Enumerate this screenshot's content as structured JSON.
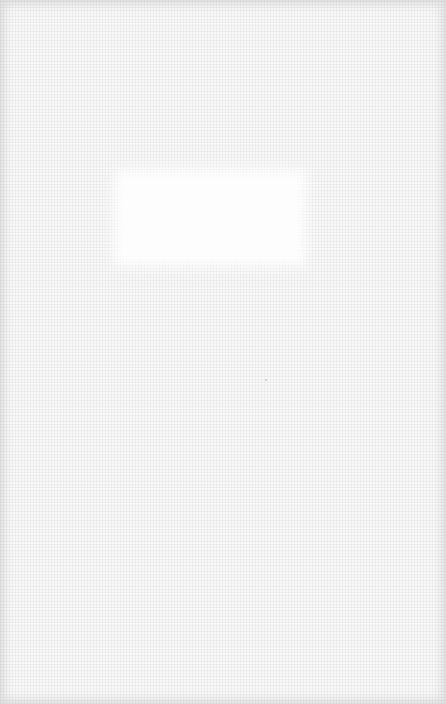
{
  "canvas": {
    "description": "blank white linen texture",
    "background_color": "#f7f7f7",
    "highlight_color": "#ffffff",
    "edge_shade_color": "#e0e0e0"
  }
}
